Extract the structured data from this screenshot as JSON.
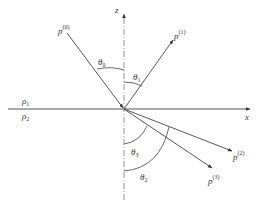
{
  "diagram": {
    "colors": {
      "line": "#444444",
      "axis": "#555555",
      "dashed": "#888888",
      "text": "#333333",
      "background": "#ffffff"
    },
    "axes": {
      "x_label": "x",
      "z_label": "z"
    },
    "media": {
      "upper": {
        "symbol": "ρ",
        "subscript": "1"
      },
      "lower": {
        "symbol": "ρ",
        "subscript": "2"
      }
    },
    "waves": [
      {
        "id": "incident",
        "symbol": "p",
        "superscript": "(0)"
      },
      {
        "id": "reflected",
        "symbol": "p",
        "superscript": "(1)"
      },
      {
        "id": "transmitted-2",
        "symbol": "p",
        "superscript": "(2)"
      },
      {
        "id": "transmitted-3",
        "symbol": "p",
        "superscript": "(3)"
      }
    ],
    "angles": [
      {
        "id": "theta0",
        "symbol": "θ",
        "subscript": "0"
      },
      {
        "id": "theta1",
        "symbol": "θ",
        "subscript": "1"
      },
      {
        "id": "theta3",
        "symbol": "θ",
        "subscript": "3"
      },
      {
        "id": "theta2",
        "symbol": "θ",
        "subscript": "2"
      }
    ]
  }
}
